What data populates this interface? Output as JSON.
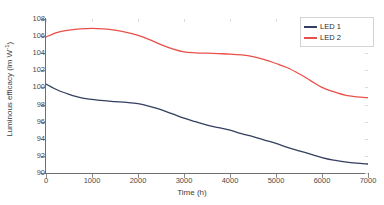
{
  "chart_data": {
    "type": "line",
    "title": "",
    "xlabel": "Time (h)",
    "ylabel": "Luminous efficacy (lm W⁻¹)",
    "ylabel_base": "Luminous efficacy (lm W",
    "ylabel_sup": "-1",
    "ylabel_close": ")",
    "xlim": [
      0,
      7000
    ],
    "ylim": [
      90,
      108
    ],
    "xticks": [
      0,
      1000,
      2000,
      3000,
      4000,
      5000,
      6000,
      7000
    ],
    "yticks": [
      90,
      92,
      94,
      96,
      98,
      100,
      102,
      104,
      106,
      108
    ],
    "xticklabels": [
      "0",
      "1000",
      "2000",
      "3000",
      "4000",
      "5000",
      "6000",
      "7000"
    ],
    "yticklabels": [
      "90",
      "92",
      "94",
      "96",
      "98",
      "100",
      "102",
      "104",
      "106",
      "108"
    ],
    "grid": false,
    "legend_position": "top-right",
    "x": [
      0,
      250,
      500,
      750,
      1000,
      1250,
      1500,
      1750,
      2000,
      2250,
      2500,
      2750,
      3000,
      3250,
      3500,
      3750,
      4000,
      4250,
      4500,
      4750,
      5000,
      5250,
      5500,
      5750,
      6000,
      6250,
      6500,
      6750,
      7000
    ],
    "series": [
      {
        "name": "LED 1",
        "color": "#333f5e",
        "values": [
          100.4,
          99.7,
          99.2,
          98.8,
          98.6,
          98.45,
          98.35,
          98.25,
          98.1,
          97.8,
          97.4,
          96.9,
          96.4,
          96.0,
          95.6,
          95.3,
          95.0,
          94.6,
          94.25,
          93.85,
          93.45,
          93.0,
          92.6,
          92.2,
          91.8,
          91.5,
          91.3,
          91.15,
          91.05
        ]
      },
      {
        "name": "LED 2",
        "color": "#e8514a",
        "values": [
          105.9,
          106.45,
          106.7,
          106.85,
          106.9,
          106.85,
          106.7,
          106.45,
          106.1,
          105.6,
          105.0,
          104.5,
          104.15,
          104.05,
          104.0,
          103.95,
          103.9,
          103.8,
          103.6,
          103.25,
          102.8,
          102.3,
          101.6,
          100.8,
          100.0,
          99.5,
          99.1,
          98.9,
          98.8
        ]
      }
    ]
  },
  "legend": {
    "items": [
      {
        "label": "LED 1",
        "color": "#333f5e"
      },
      {
        "label": "LED 2",
        "color": "#e8514a"
      }
    ]
  }
}
